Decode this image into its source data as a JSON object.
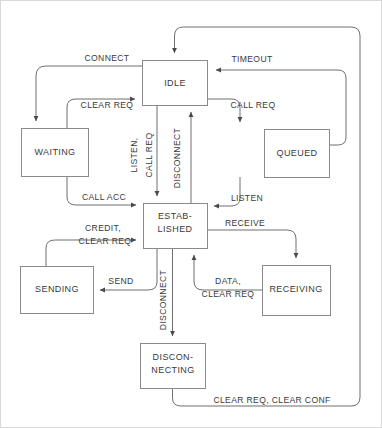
{
  "diagram": {
    "colors": {
      "background": "#ffffff",
      "box_stroke": "#8a8a8a",
      "edge_stroke": "#6f6f6f",
      "text": "#3a3a3a",
      "frame": "#d9d9d9"
    },
    "states": [
      {
        "id": "idle",
        "label": "IDLE",
        "x": 142,
        "y": 60,
        "w": 65,
        "h": 45,
        "lines": [
          "IDLE"
        ]
      },
      {
        "id": "waiting",
        "label": "WAITING",
        "x": 21,
        "y": 128,
        "w": 67,
        "h": 48,
        "lines": [
          "WAITING"
        ]
      },
      {
        "id": "queued",
        "label": "QUEUED",
        "x": 264,
        "y": 129,
        "w": 65,
        "h": 48,
        "lines": [
          "QUEUED"
        ]
      },
      {
        "id": "established",
        "label": "ESTAB-LISHED",
        "x": 143,
        "y": 203,
        "w": 64,
        "h": 45,
        "lines": [
          "ESTAB-",
          "LISHED"
        ]
      },
      {
        "id": "sending",
        "label": "SENDING",
        "x": 20,
        "y": 266,
        "w": 73,
        "h": 47,
        "lines": [
          "SENDING"
        ]
      },
      {
        "id": "receiving",
        "label": "RECEIVING",
        "x": 262,
        "y": 265,
        "w": 68,
        "h": 50,
        "lines": [
          "RECEIVING"
        ]
      },
      {
        "id": "disconnecting",
        "label": "DISCON-NECTING",
        "x": 140,
        "y": 343,
        "w": 65,
        "h": 45,
        "lines": [
          "DISCON-",
          "NECTING"
        ]
      }
    ],
    "transitions": [
      {
        "id": "connect",
        "label": "CONNECT",
        "from": "idle",
        "to": "waiting"
      },
      {
        "id": "clear-req-waiting",
        "label": "CLEAR REQ",
        "from": "waiting",
        "to": "idle"
      },
      {
        "id": "timeout",
        "label": "TIMEOUT",
        "from": "queued",
        "to": "idle"
      },
      {
        "id": "call-req",
        "label": "CALL REQ",
        "from": "idle",
        "to": "queued"
      },
      {
        "id": "call-acc",
        "label": "CALL ACC",
        "from": "waiting",
        "to": "established"
      },
      {
        "id": "listen-vertical",
        "label": "LISTEN,",
        "from": "idle",
        "to": "established"
      },
      {
        "id": "call-req-vertical",
        "label": "CALL REQ",
        "from": "idle",
        "to": "established"
      },
      {
        "id": "disconnect-up",
        "label": "DISCONNECT",
        "from": "established",
        "to": "idle"
      },
      {
        "id": "listen-queued",
        "label": "LISTEN",
        "from": "queued",
        "to": "established"
      },
      {
        "id": "credit-clear-req",
        "label": "CREDIT,",
        "from": "sending",
        "to": "established"
      },
      {
        "id": "credit-clear-req-2",
        "label": "CLEAR REQ",
        "from": "sending",
        "to": "established"
      },
      {
        "id": "send",
        "label": "SEND",
        "from": "established",
        "to": "sending"
      },
      {
        "id": "receive",
        "label": "RECEIVE",
        "from": "established",
        "to": "receiving"
      },
      {
        "id": "data-clear-req",
        "label": "DATA,",
        "from": "receiving",
        "to": "established"
      },
      {
        "id": "data-clear-req-2",
        "label": "CLEAR REQ",
        "from": "receiving",
        "to": "established"
      },
      {
        "id": "disconnect-down",
        "label": "DISCONNECT",
        "from": "established",
        "to": "disconnecting"
      },
      {
        "id": "clear-req-conf",
        "label": "CLEAR REQ, CLEAR CONF",
        "from": "disconnecting",
        "to": "idle"
      }
    ],
    "edge_labels": {
      "connect": "CONNECT",
      "timeout": "TIMEOUT",
      "clear_req_waiting": "CLEAR REQ",
      "call_req_right": "CALL REQ",
      "listen_vert": "LISTEN,",
      "call_req_vert": "CALL REQ",
      "disconnect_vert": "DISCONNECT",
      "call_acc": "CALL ACC",
      "listen_queued": "LISTEN",
      "credit": "CREDIT,",
      "clear_req_sending": "CLEAR REQ",
      "receive": "RECEIVE",
      "send": "SEND",
      "data": "DATA,",
      "clear_req_receiving": "CLEAR REQ",
      "disconnect_down": "DISCONNECT",
      "clear_req_clear_conf": "CLEAR REQ, CLEAR CONF"
    }
  }
}
